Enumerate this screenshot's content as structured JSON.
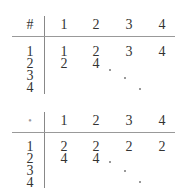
{
  "tables": [
    {
      "corner": "#",
      "col_headers": [
        "1",
        "2",
        "3",
        "4"
      ],
      "row_headers": [
        "1",
        "2",
        "3",
        "4"
      ],
      "rows": [
        [
          "1",
          "2",
          "3",
          "4"
        ],
        [
          "2",
          "4",
          "",
          ""
        ],
        [
          "",
          "",
          "",
          ""
        ],
        [
          "",
          "",
          "",
          ""
        ]
      ],
      "ellipsis": "diagonal dots"
    },
    {
      "corner": "•",
      "col_headers": [
        "1",
        "2",
        "3",
        "4"
      ],
      "row_headers": [
        "1",
        "2",
        "3",
        "4"
      ],
      "rows": [
        [
          "2",
          "2",
          "2",
          "2"
        ],
        [
          "4",
          "4",
          "",
          ""
        ],
        [
          "",
          "",
          "",
          ""
        ],
        [
          "",
          "",
          "",
          ""
        ]
      ],
      "ellipsis": "diagonal dots"
    }
  ]
}
